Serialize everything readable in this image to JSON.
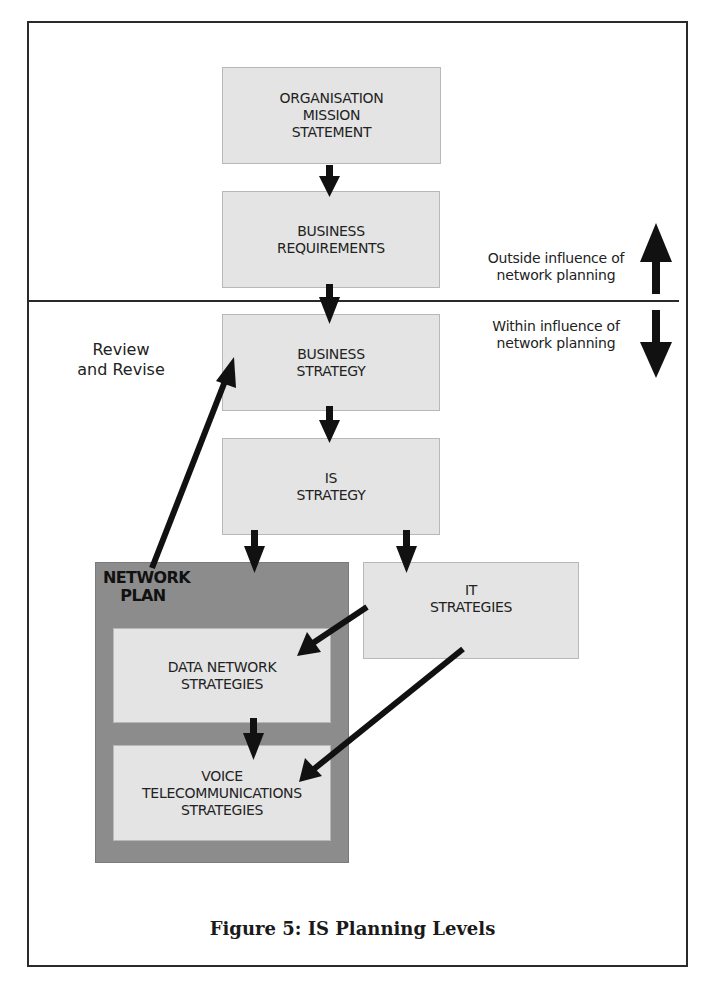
{
  "figure": {
    "caption": "Figure 5: IS Planning Levels"
  },
  "nodes": {
    "mission": "ORGANISATION\nMISSION\nSTATEMENT",
    "business_requirements": "BUSINESS\nREQUIREMENTS",
    "business_strategy": "BUSINESS\nSTRATEGY",
    "is_strategy": "IS\nSTRATEGY",
    "it_strategies": "IT\nSTRATEGIES",
    "network_plan": "NETWORK\nPLAN",
    "data_network": "DATA NETWORK\nSTRATEGIES",
    "voice_telecom": "VOICE\nTELECOMMUNICATIONS\nSTRATEGIES"
  },
  "labels": {
    "outside": "Outside influence of\nnetwork planning",
    "within": "Within influence of\nnetwork planning",
    "review": "Review\nand Revise"
  },
  "colors": {
    "box_fill": "#e4e4e4",
    "network_plan_fill": "#8c8c8c",
    "arrow": "#111111"
  }
}
